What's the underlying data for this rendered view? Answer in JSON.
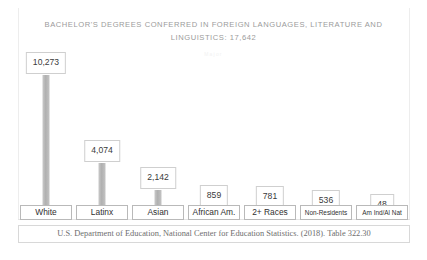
{
  "chart_data": {
    "type": "bar",
    "title": "BACHELOR'S DEGREES CONFERRED IN FOREIGN LANGUAGES, LITERATURE AND LINGUISTICS: 17,642",
    "subtitle": "Major",
    "categories": [
      "White",
      "Latinx",
      "Asian",
      "African Am.",
      "2+ Races",
      "Non-Residents",
      "Am Ind/Al Nat"
    ],
    "values": [
      10273,
      4074,
      2142,
      859,
      781,
      536,
      48
    ],
    "value_labels": [
      "10,273",
      "4,074",
      "2,142",
      "859",
      "781",
      "536",
      "48"
    ],
    "xlabel": "",
    "ylabel": "",
    "ylim": [
      0,
      10273
    ],
    "grid": false,
    "legend": "none",
    "total": "17,642",
    "bar_color": "#b6b6b6",
    "title_color": "#9b9b9b",
    "label_box_border": "#cfcfcf"
  },
  "footer": {
    "source": "U.S. Department of Education, National Center for Education Statistics. (2018). Table 322.30"
  }
}
